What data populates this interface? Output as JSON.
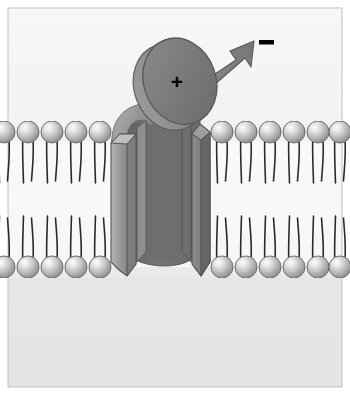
{
  "figure": {
    "width": 350,
    "height": 395
  },
  "frame": {
    "name": "illustration-border",
    "border_color": "#bfbfbf",
    "background_top_color": "#f4f4f4",
    "background_bottom_color": "#e6e6e6"
  },
  "labels": {
    "positive_charge": "+",
    "negative_charge": "—"
  },
  "colors": {
    "protein_dark": "#6e6e6e",
    "protein_mid": "#8a8a8a",
    "protein_light": "#b0b0b0",
    "protein_outline": "#4a4a4a",
    "disc_face": "#7a7a7a",
    "disc_edge": "#6a6a6a",
    "arrow_fill": "#7d7d7d",
    "arrow_outline": "#5a5a5a",
    "lipid_head_light": "#f2f2f2",
    "lipid_head_mid": "#bdbdbd",
    "lipid_head_dark": "#8e8e8e",
    "lipid_tail": "#2b2b2b",
    "charge_text": "#000000",
    "extracellular_bg": "#f2f2f2",
    "intracellular_bg": "#e4e4e4",
    "bilayer_core": "#fafafa"
  },
  "membrane": {
    "name": "lipid-bilayer",
    "upper_leaflet_label": "outer leaflet",
    "lower_leaflet_label": "inner leaflet",
    "upper_head_y": 132,
    "lower_head_y": 267,
    "head_radius": 11,
    "tail_length": 52,
    "upper_heads_left_x": [
      4,
      28,
      52,
      76,
      100
    ],
    "upper_heads_right_x": [
      222,
      246,
      270,
      294,
      318,
      342
    ],
    "lower_heads_left_x": [
      4,
      28,
      52,
      76,
      100
    ],
    "lower_heads_right_x": [
      222,
      246,
      270,
      294,
      318,
      342
    ]
  },
  "channel": {
    "name": "ion-channel-protein",
    "pore_label": "pore",
    "left_column_x": 122,
    "right_column_x": 190,
    "column_width": 16,
    "top_y": 118,
    "bottom_y": 282,
    "back_wall_color": "#6e6e6e"
  },
  "voltage_sensor": {
    "name": "voltage-sensor-disc",
    "charge": "+",
    "center_x": 178,
    "center_y": 82,
    "radius_x": 38,
    "radius_y": 44,
    "rotation_deg": -22
  },
  "arrow": {
    "name": "movement-arrow",
    "from_x": 196,
    "from_y": 78,
    "to_x": 256,
    "to_y": 44,
    "direction": "up-right"
  },
  "negative_marker": {
    "name": "negative-charge-marker",
    "x": 262,
    "y": 43,
    "width": 14,
    "height": 4
  }
}
